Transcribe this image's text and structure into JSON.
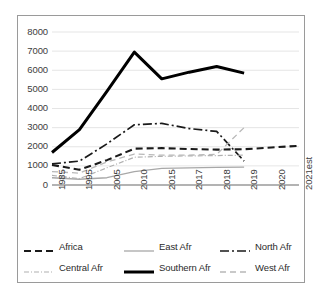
{
  "chart_data": {
    "type": "line",
    "title": "",
    "xlabel": "",
    "ylabel": "",
    "categories": [
      "1985",
      "1995",
      "2005",
      "2010",
      "2015",
      "2017",
      "2018",
      "2019",
      "2020",
      "2021est"
    ],
    "ylim": [
      0,
      8000
    ],
    "ytick_values": [
      0,
      1000,
      2000,
      3000,
      4000,
      5000,
      6000,
      7000,
      8000
    ],
    "ytick_labels": [
      "0",
      "1000",
      "2000",
      "3000",
      "4000",
      "5000",
      "6000",
      "7000",
      "8000"
    ],
    "grid": true,
    "legend_position": "bottom",
    "series": [
      {
        "name": "Africa",
        "style": "dashed",
        "color": "#1a1a1a",
        "width": 2.1,
        "dash": "7,4",
        "values": [
          1050,
          800,
          1300,
          1900,
          1930,
          1880,
          1850,
          1870,
          1960,
          2050
        ]
      },
      {
        "name": "East Afr",
        "style": "solid",
        "color": "#a8a8a8",
        "width": 1.3,
        "dash": "",
        "values": [
          380,
          300,
          380,
          700,
          870,
          900,
          920,
          930,
          null,
          null
        ]
      },
      {
        "name": "North Afr",
        "style": "dash-dot",
        "color": "#1a1a1a",
        "width": 1.7,
        "dash": "9,3,2,3",
        "values": [
          1100,
          1250,
          2150,
          3150,
          3220,
          2950,
          2800,
          1250,
          null,
          null
        ]
      },
      {
        "name": "Central Afr",
        "style": "fine-dash-dot",
        "color": "#b0b0b0",
        "width": 1.2,
        "dash": "5,2,1,2",
        "values": [
          500,
          330,
          900,
          1450,
          1500,
          1520,
          1540,
          1560,
          null,
          null
        ]
      },
      {
        "name": "Southern Afr",
        "style": "solid-bold",
        "color": "#000000",
        "width": 3.0,
        "dash": "",
        "values": [
          1700,
          2900,
          4900,
          6950,
          5550,
          5900,
          6200,
          5850,
          null,
          null
        ]
      },
      {
        "name": "West Afr",
        "style": "light-dashed",
        "color": "#b8b8b8",
        "width": 1.3,
        "dash": "6,4",
        "values": [
          700,
          620,
          1200,
          1620,
          1560,
          1560,
          1600,
          3000,
          null,
          null
        ]
      }
    ]
  },
  "legend": {
    "items": [
      {
        "label": "Africa"
      },
      {
        "label": "East Afr"
      },
      {
        "label": "North Afr"
      },
      {
        "label": "Central Afr"
      },
      {
        "label": "Southern Afr"
      },
      {
        "label": "West Afr"
      }
    ]
  }
}
